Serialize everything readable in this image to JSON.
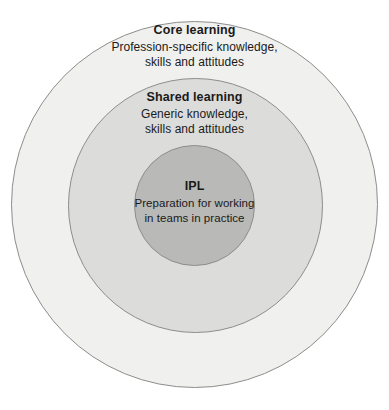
{
  "diagram": {
    "type": "concentric-circles",
    "background_color": "#ffffff",
    "layers": [
      {
        "key": "core",
        "title": "Core learning",
        "lines": [
          "Profession-specific knowledge,",
          "skills and attitudes"
        ],
        "fill_color": "#f0f0ee",
        "stroke_color": "#8d8d8b"
      },
      {
        "key": "shared",
        "title": "Shared learning",
        "lines": [
          "Generic knowledge,",
          "skills and attitudes"
        ],
        "fill_color": "#dcdcda",
        "stroke_color": "#8d8d8b"
      },
      {
        "key": "ipl",
        "title": "IPL",
        "lines": [
          "Preparation for working",
          "in teams in practice"
        ],
        "fill_color": "#b9b9b7",
        "stroke_color": "#8d8d8b"
      }
    ]
  }
}
